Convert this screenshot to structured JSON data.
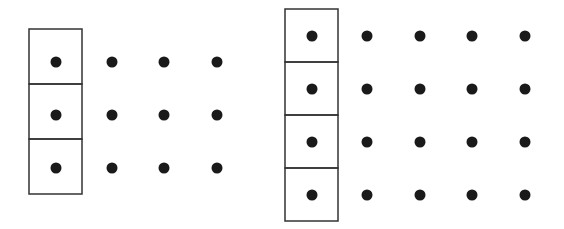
{
  "figures": [
    {
      "name": "grid-3x4",
      "rows": 3,
      "cols": 4,
      "box_column": 0,
      "box": {
        "x": 29,
        "y": 29,
        "cell_w": 53,
        "cell_h": 55
      },
      "dot_x": [
        56,
        112,
        164,
        217
      ],
      "dot_y": [
        62,
        115,
        168
      ]
    },
    {
      "name": "grid-4x5",
      "rows": 4,
      "cols": 5,
      "box_column": 0,
      "box": {
        "x": 285,
        "y": 9,
        "cell_w": 53,
        "cell_h": 53
      },
      "dot_x": [
        312,
        367,
        420,
        472,
        525
      ],
      "dot_y": [
        36,
        89,
        142,
        195
      ]
    }
  ],
  "colors": {
    "dot": "#1a1a1a",
    "line": "#333333",
    "background": "#ffffff"
  },
  "dot_radius": 5.5
}
